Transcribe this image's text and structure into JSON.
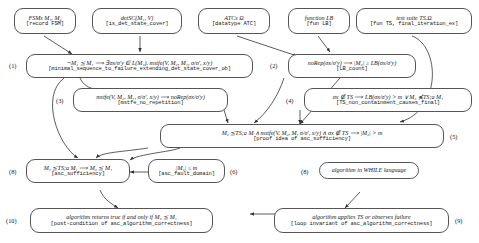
{
  "diagram": {
    "nodes": [
      {
        "id": "fsms",
        "tag": "",
        "line1": "FSMs M₁, M₂",
        "line2": "[record FSM]"
      },
      {
        "id": "detsc",
        "tag": "",
        "line1": "detSC(M₁, V)",
        "line2": "[is_det_state_cover]"
      },
      {
        "id": "atcs",
        "tag": "",
        "line1": "ATCs Ω",
        "line2": "[datatype ATC]"
      },
      {
        "id": "lb",
        "tag": "",
        "line1": "function LB",
        "line2": "[fun LB]"
      },
      {
        "id": "ts",
        "tag": "",
        "line1": "test suite TS.Ω",
        "line2": "[fun TS, final_iteration_ex]"
      },
      {
        "id": "n1",
        "tag": "(1)",
        "line1": "¬M₂ ⪯ M₁ ⟹ ∃σx/σ′y ∈ L(M₂). mstfe(V, M₂, M₁, σ/σ′, x/y)",
        "line2": "[minimal_sequence_to_failure_extending_det_state_cover_ob]"
      },
      {
        "id": "n2",
        "tag": "(2)",
        "line1": "noRep(σx/σ′y) ⟹ |M₂| ≥ LB(σx/σ′y)",
        "line2": "[LB_count]"
      },
      {
        "id": "n3",
        "tag": "(3)",
        "line1": "mstfe(V, M₂, M₁, σ/σ′, x/y) ⟹ noRep(σx/σ′y)",
        "line2": "[mstfe_no_repetition]"
      },
      {
        "id": "n4",
        "tag": "(4)",
        "line1": "σx ∉ TS ⟹ LB(σx/σ′y) > m ∨ M₂ ⋠TS;a M₁",
        "line2": "[TS_non_containment_causes_final]"
      },
      {
        "id": "n5",
        "tag": "(5)",
        "line1": "M₂ ⪯TS;a M ∧ mstfe(V, M₂, M, σ/σ′, x/y) ∧ σx ∉ TS ⟹ |M₂| > m",
        "line2": "[proof idea of asc_sufficiency]"
      },
      {
        "id": "n6",
        "tag": "(6)",
        "line1": "|M₂| ≤ m",
        "line2": "[asc_fault_domain]"
      },
      {
        "id": "n7",
        "tag": "(7)",
        "line1": "M₂ ⪯TS;a M₁ ⟹ M₂ ⪯ M₁",
        "line2": "[asc_sufficiency]"
      },
      {
        "id": "n8",
        "tag": "(8)",
        "line1": "algorithm in WHILE language",
        "line2": ""
      },
      {
        "id": "n9",
        "tag": "(9)",
        "line1": "algorithm applies TS or observes failure",
        "line2": "[loop invariant of asc_algorithm_correctness]"
      },
      {
        "id": "n10",
        "tag": "(10)",
        "line1": "algorithm returns true if and only if M₂ ⪯ M₁",
        "line2": "[post-condition of asc_algorithm_correctness]"
      }
    ]
  }
}
